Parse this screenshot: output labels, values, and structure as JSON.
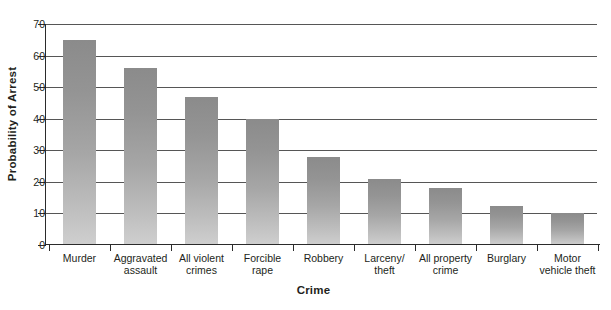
{
  "chart_data": {
    "type": "bar",
    "title": "",
    "xlabel": "Crime",
    "ylabel": "Probability of Arrest",
    "ylim": [
      0,
      70
    ],
    "ytick_step": 10,
    "yticks": [
      0,
      10,
      20,
      30,
      40,
      50,
      60,
      70
    ],
    "grid": "horizontal",
    "legend": "none",
    "categories": [
      "Murder",
      "Aggravated assault",
      "All violent crimes",
      "Forcible rape",
      "Robbery",
      "Larceny/ theft",
      "All property crime",
      "Burglary",
      "Motor vehicle theft"
    ],
    "category_lines": [
      [
        "Murder"
      ],
      [
        "Aggravated",
        "assault"
      ],
      [
        "All violent",
        "crimes"
      ],
      [
        "Forcible",
        "rape"
      ],
      [
        "Robbery"
      ],
      [
        "Larceny/",
        "theft"
      ],
      [
        "All property",
        "crime"
      ],
      [
        "Burglary"
      ],
      [
        "Motor",
        "vehicle theft"
      ]
    ],
    "values": [
      65,
      56,
      47,
      40,
      28,
      21,
      18,
      12.5,
      10
    ],
    "bar_color_top": "#8b8b8b",
    "bar_color_bottom": "#cfcfcf",
    "axis_color": "#2b2b2b",
    "gridline_color": "#565656",
    "background": "#ffffff"
  }
}
